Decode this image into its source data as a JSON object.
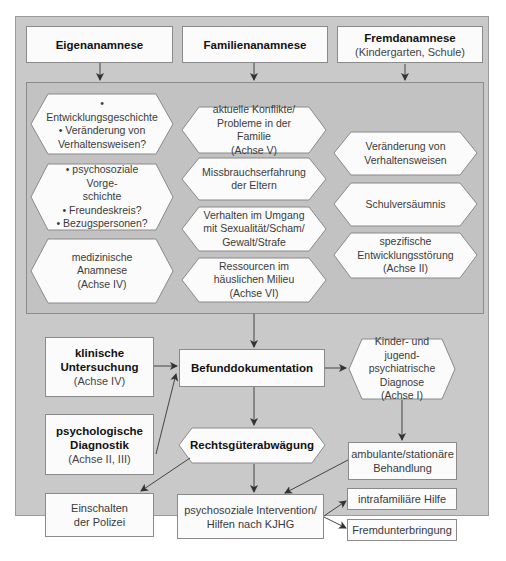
{
  "diagram": {
    "top_sources": [
      {
        "title": "Eigenanamnese",
        "subtitle": ""
      },
      {
        "title": "Familienanamnese",
        "subtitle": ""
      },
      {
        "title": "Fremdanamnese",
        "subtitle": "(Kindergarten, Schule)"
      }
    ],
    "eigen_items": [
      {
        "lines": [
          "• Entwicklungsgeschichte",
          "• Veränderung von",
          "Verhaltensweisen?"
        ]
      },
      {
        "lines": [
          "• psychosoziale Vorge-",
          "schichte",
          "• Freundeskreis?",
          "• Bezugspersonen?"
        ]
      },
      {
        "lines": [
          "medizinische Anamnese",
          "(Achse IV)"
        ]
      }
    ],
    "familien_items": [
      {
        "lines": [
          "aktuelle Konflikte/",
          "Probleme in der Familie",
          "(Achse V)"
        ]
      },
      {
        "lines": [
          "Missbrauchserfahrung",
          "der Eltern"
        ]
      },
      {
        "lines": [
          "Verhalten im Umgang",
          "mit Sexualität/Scham/",
          "Gewalt/Strafe"
        ]
      },
      {
        "lines": [
          "Ressourcen im",
          "häuslichen Milieu",
          "(Achse VI)"
        ]
      }
    ],
    "fremd_items": [
      {
        "lines": [
          "Veränderung von",
          "Verhaltensweisen"
        ]
      },
      {
        "lines": [
          "Schulversäumnis"
        ]
      },
      {
        "lines": [
          "spezifische",
          "Entwicklungsstörung",
          "(Achse II)"
        ]
      }
    ],
    "klinische": {
      "title1": "klinische",
      "title2": "Untersuchung",
      "subtitle": "(Achse IV)"
    },
    "psychologische": {
      "title1": "psychologische",
      "title2": "Diagnostik",
      "subtitle": "(Achse II, III)"
    },
    "befund": {
      "title": "Befunddokumentation"
    },
    "diagnose": {
      "lines": [
        "Kinder- und jugend-",
        "psychiatrische",
        "Diagnose",
        "(Achse I)"
      ]
    },
    "rechtsgueter": {
      "title": "Rechtsgüterabwägung"
    },
    "behandlung": {
      "lines": [
        "ambulante/stationäre",
        "Behandlung"
      ]
    },
    "polizei": {
      "lines": [
        "Einschalten",
        "der Polizei"
      ]
    },
    "intervention": {
      "lines": [
        "psychosoziale Intervention/",
        "Hilfen nach KJHG"
      ]
    },
    "intrafamiliaer": {
      "title": "intrafamiliäre Hilfe"
    },
    "fremdunterbringung": {
      "title": "Fremdunterbringung"
    },
    "colors": {
      "panel": "#c9c9c9",
      "inner_panel": "#c2c2c2",
      "box_fill": "#fbfbfb",
      "border": "#8a8a8a",
      "arrow": "#333333"
    }
  }
}
